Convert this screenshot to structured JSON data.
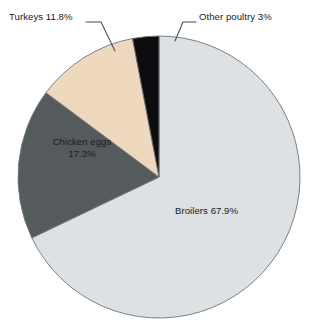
{
  "chart_data": {
    "type": "pie",
    "title": "",
    "subtitle": "",
    "xlabel": "",
    "ylabel": "",
    "grid": false,
    "legend_position": "none",
    "units": "percent",
    "categories": [
      "Broilers",
      "Chicken eggs",
      "Turkeys",
      "Other poultry"
    ],
    "values": [
      67.9,
      17.3,
      11.8,
      3
    ],
    "slices": [
      {
        "name": "Broilers",
        "value": 67.9,
        "label": "Broilers 67.9%",
        "color": "#dde1e3",
        "label_placement": "inside",
        "start_angle_deg": 115.2,
        "end_angle_deg": 359.0
      },
      {
        "name": "Chicken eggs",
        "value": 17.3,
        "label_line1": "Chicken eggs",
        "label_line2": "17.3%",
        "color": "#555a5d",
        "label_placement": "inside",
        "start_angle_deg": 53.0,
        "end_angle_deg": 115.2
      },
      {
        "name": "Turkeys",
        "value": 11.8,
        "label": "Turkeys 11.8%",
        "color": "#eed9be",
        "label_placement": "outside-leader",
        "start_angle_deg": 10.5,
        "end_angle_deg": 53.0
      },
      {
        "name": "Other poultry",
        "value": 3,
        "label": "Other poultry 3%",
        "color": "#0d0d0f",
        "label_placement": "outside-leader",
        "start_angle_deg": 0.0,
        "end_angle_deg": 10.5
      }
    ],
    "geometry": {
      "center_x": 159,
      "center_y": 177,
      "radius": 141,
      "start_at_top": true,
      "direction": "counterclockwise"
    },
    "colors": {
      "broilers": "#dde1e3",
      "chicken_eggs": "#555a5d",
      "turkeys": "#eed9be",
      "other_poultry": "#0d0d0f",
      "outline": "#6f7376",
      "leader": "#4a4a4a",
      "background": "#ffffff",
      "text": "#1b1b1b"
    }
  },
  "labels": {
    "turkeys": "Turkeys 11.8%",
    "other_poultry": "Other poultry 3%",
    "chicken_eggs_line1": "Chicken eggs",
    "chicken_eggs_line2": "17.3%",
    "broilers": "Broilers 67.9%"
  }
}
